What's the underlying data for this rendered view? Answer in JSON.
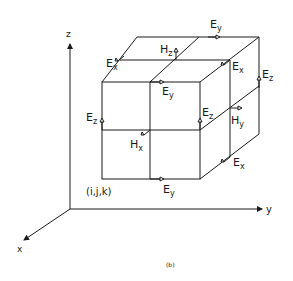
{
  "figure": {
    "caption": "(b)",
    "origin_label": "(i,j,k)",
    "axes": {
      "x": "x",
      "y": "y",
      "z": "z"
    },
    "fields": [
      {
        "name": "E",
        "sub": "x",
        "pos": "top-left-back"
      },
      {
        "name": "H",
        "sub": "z",
        "pos": "top-center"
      },
      {
        "name": "E",
        "sub": "y",
        "pos": "top-back"
      },
      {
        "name": "E",
        "sub": "x",
        "pos": "top-right"
      },
      {
        "name": "E",
        "sub": "y",
        "pos": "top-front"
      },
      {
        "name": "E",
        "sub": "z",
        "pos": "right-back"
      },
      {
        "name": "E",
        "sub": "z",
        "pos": "left-front"
      },
      {
        "name": "E",
        "sub": "z",
        "pos": "front-right"
      },
      {
        "name": "H",
        "sub": "y",
        "pos": "right-center"
      },
      {
        "name": "H",
        "sub": "x",
        "pos": "front-center"
      },
      {
        "name": "E",
        "sub": "x",
        "pos": "bottom-right"
      },
      {
        "name": "E",
        "sub": "y",
        "pos": "bottom-front"
      }
    ]
  }
}
